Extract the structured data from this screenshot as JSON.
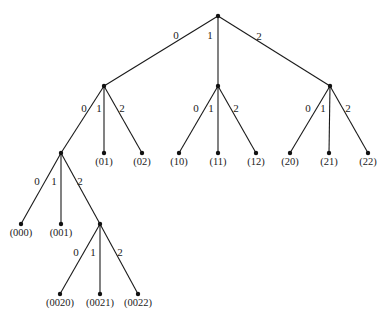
{
  "diagram": {
    "type": "ternary-tree",
    "nodes": [
      {
        "id": "root",
        "x": 218,
        "y": 16,
        "label": ""
      },
      {
        "id": "0",
        "x": 104,
        "y": 86,
        "label": ""
      },
      {
        "id": "1",
        "x": 218,
        "y": 86,
        "label": ""
      },
      {
        "id": "2",
        "x": 330,
        "y": 86,
        "label": ""
      },
      {
        "id": "00",
        "x": 61,
        "y": 153,
        "label": ""
      },
      {
        "id": "01",
        "x": 104,
        "y": 153,
        "label": "(01)"
      },
      {
        "id": "02",
        "x": 142,
        "y": 153,
        "label": "(02)"
      },
      {
        "id": "10",
        "x": 179,
        "y": 153,
        "label": "(10)"
      },
      {
        "id": "11",
        "x": 218,
        "y": 153,
        "label": "(11)"
      },
      {
        "id": "12",
        "x": 256,
        "y": 153,
        "label": "(12)"
      },
      {
        "id": "20",
        "x": 290,
        "y": 153,
        "label": "(20)"
      },
      {
        "id": "21",
        "x": 329,
        "y": 153,
        "label": "(21)"
      },
      {
        "id": "22",
        "x": 368,
        "y": 153,
        "label": "(22)"
      },
      {
        "id": "000",
        "x": 21,
        "y": 224,
        "label": "(000)"
      },
      {
        "id": "001",
        "x": 61,
        "y": 224,
        "label": "(001)"
      },
      {
        "id": "002",
        "x": 100,
        "y": 224,
        "label": ""
      },
      {
        "id": "0020",
        "x": 60,
        "y": 294,
        "label": "(0020)"
      },
      {
        "id": "0021",
        "x": 100,
        "y": 294,
        "label": "(0021)"
      },
      {
        "id": "0022",
        "x": 138,
        "y": 294,
        "label": "(0022)"
      }
    ],
    "edges": [
      {
        "from": "root",
        "to": "0",
        "label": "0",
        "lx": 176,
        "ly": 39
      },
      {
        "from": "root",
        "to": "1",
        "label": "1",
        "lx": 210,
        "ly": 39
      },
      {
        "from": "root",
        "to": "2",
        "label": "2",
        "lx": 259,
        "ly": 40
      },
      {
        "from": "0",
        "to": "00",
        "label": "0",
        "lx": 84,
        "ly": 112
      },
      {
        "from": "0",
        "to": "01",
        "label": "1",
        "lx": 99,
        "ly": 112
      },
      {
        "from": "0",
        "to": "02",
        "label": "2",
        "lx": 122,
        "ly": 112
      },
      {
        "from": "1",
        "to": "10",
        "label": "0",
        "lx": 196,
        "ly": 112
      },
      {
        "from": "1",
        "to": "11",
        "label": "1",
        "lx": 211,
        "ly": 112
      },
      {
        "from": "1",
        "to": "12",
        "label": "2",
        "lx": 236,
        "ly": 112
      },
      {
        "from": "2",
        "to": "20",
        "label": "0",
        "lx": 308,
        "ly": 112
      },
      {
        "from": "2",
        "to": "21",
        "label": "1",
        "lx": 323,
        "ly": 112
      },
      {
        "from": "2",
        "to": "22",
        "label": "2",
        "lx": 348,
        "ly": 112
      },
      {
        "from": "00",
        "to": "000",
        "label": "0",
        "lx": 37,
        "ly": 185
      },
      {
        "from": "00",
        "to": "001",
        "label": "1",
        "lx": 54,
        "ly": 185
      },
      {
        "from": "00",
        "to": "002",
        "label": "2",
        "lx": 80,
        "ly": 185
      },
      {
        "from": "002",
        "to": "0020",
        "label": "0",
        "lx": 76,
        "ly": 256
      },
      {
        "from": "002",
        "to": "0021",
        "label": "1",
        "lx": 93,
        "ly": 256
      },
      {
        "from": "002",
        "to": "0022",
        "label": "2",
        "lx": 120,
        "ly": 256
      }
    ]
  }
}
